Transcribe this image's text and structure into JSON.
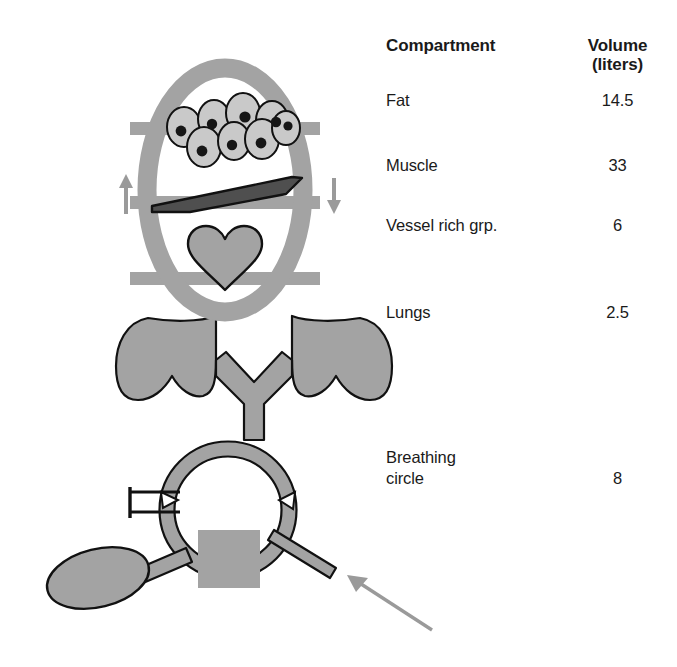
{
  "figure": {
    "table": {
      "headers": {
        "compartment": "Compartment",
        "volume_main": "Volume",
        "volume_units": "(liters)"
      },
      "rows": [
        {
          "compartment": "Fat",
          "volume": "14.5"
        },
        {
          "compartment": "Muscle",
          "volume": "33"
        },
        {
          "compartment": "Vessel rich grp.",
          "volume": "6"
        },
        {
          "compartment": "Lungs",
          "volume": "2.5"
        },
        {
          "compartment": "Breathing\ncircle",
          "volume": "8"
        }
      ]
    },
    "diagram": {
      "body_outline": "body-oval-outline",
      "compartment_bands": [
        "fat-band",
        "muscle-band",
        "vessel-rich-band"
      ],
      "elements": {
        "fat_cells": "fat-cells-cluster",
        "fat_cell_count": 8,
        "muscle_slab": "muscle-slab",
        "heart": "heart-shape",
        "lungs": "lungs-shape",
        "trachea": "trachea-tube",
        "breathing_ring": "breathing-circle-ring",
        "one_way_valves": 2,
        "reservoir_bag": "reservoir-bag",
        "co2_absorber": "co2-absorber-canister",
        "fresh_gas_tube": "fresh-gas-tube",
        "y_piece": "y-piece-connector"
      },
      "arrows": {
        "left_arrow": "up",
        "right_arrow": "down",
        "pointer_arrow": "fresh-gas-inflow-pointer"
      }
    },
    "colors": {
      "gray_fill": "#a3a3a3",
      "light_gray_fill": "#c9c9c9",
      "dark_gray_fill": "#4f4f4f",
      "outline": "#111111",
      "arrow_gray": "#9a9a9a",
      "text": "#1a1a1a",
      "background": "#ffffff"
    }
  }
}
